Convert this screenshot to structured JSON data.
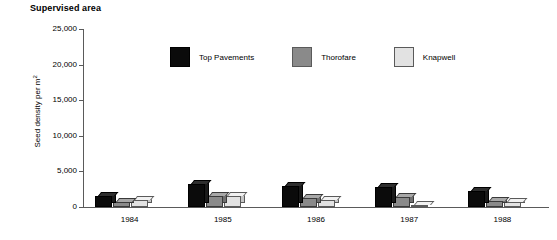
{
  "chart_data": {
    "type": "bar",
    "title": "Supervised area",
    "xlabel": "",
    "ylabel": "Seed density per m",
    "ylabel_sup": "2",
    "categories": [
      "1984",
      "1985",
      "1986",
      "1987",
      "1988"
    ],
    "ylim": [
      0,
      25000
    ],
    "yticks": [
      0,
      5000,
      10000,
      15000,
      20000,
      25000
    ],
    "ytick_labels": [
      "0",
      "5,000",
      "10,000",
      "15,000",
      "20,000",
      "25,000"
    ],
    "grid": false,
    "legend_position": "top-center",
    "series": [
      {
        "name": "Top Pavements",
        "color": "#0b0b0b",
        "values": [
          1550,
          3250,
          3000,
          2800,
          2250
        ]
      },
      {
        "name": "Thorofare",
        "color": "#8a8a8a",
        "values": [
          700,
          1550,
          1200,
          1400,
          900
        ]
      },
      {
        "name": "Knapwell",
        "color": "#e2e2e2",
        "values": [
          1000,
          1500,
          1050,
          350,
          750
        ]
      }
    ]
  },
  "legend": {
    "items": [
      {
        "label": "Top Pavements",
        "swatch_class": "s0"
      },
      {
        "label": "Thorofare",
        "swatch_class": "s1"
      },
      {
        "label": "Knapwell",
        "swatch_class": "s2"
      }
    ]
  }
}
